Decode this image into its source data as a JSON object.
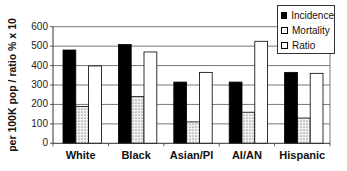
{
  "chart_data": {
    "type": "bar",
    "title": "",
    "xlabel": "",
    "ylabel": "per 100K pop / ratio % x 10",
    "ylim": [
      0,
      600
    ],
    "yticks": [
      0,
      100,
      200,
      300,
      400,
      500,
      600
    ],
    "grid": true,
    "legend_position": "top-right",
    "categories": [
      "White",
      "Black",
      "Asian/PI",
      "AI/AN",
      "Hispanic"
    ],
    "series": [
      {
        "name": "Incidence",
        "values": [
          480,
          508,
          315,
          315,
          365
        ],
        "fill": "#000000",
        "pattern": "solid"
      },
      {
        "name": "Mortality",
        "values": [
          190,
          240,
          110,
          160,
          130
        ],
        "fill": "#e6e6e6",
        "pattern": "dotted"
      },
      {
        "name": "Ratio",
        "values": [
          398,
          470,
          365,
          525,
          360
        ],
        "fill": "#ffffff",
        "pattern": "none"
      }
    ]
  },
  "axis": {
    "ylabel": "per 100K pop / ratio % x 10",
    "ticks": [
      "0",
      "100",
      "200",
      "300",
      "400",
      "500",
      "600"
    ]
  },
  "legend": {
    "items": [
      {
        "label": "Incidence",
        "icon": "solid-black-square"
      },
      {
        "label": "Mortality",
        "icon": "dotted-square"
      },
      {
        "label": "Ratio",
        "icon": "empty-square"
      }
    ]
  }
}
